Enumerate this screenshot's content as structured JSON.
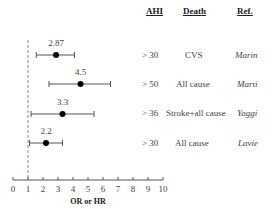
{
  "chart_data": {
    "type": "forest",
    "title": "",
    "xlabel": "OR or HR",
    "ylabel": "",
    "xlim": [
      0,
      10
    ],
    "x_ticks": [
      "0",
      "1",
      "2",
      "3",
      "4",
      "5",
      "6",
      "7",
      "8",
      "9",
      "10"
    ],
    "reference_line": 1,
    "grid": false,
    "columns": [
      "AHI",
      "Death",
      "Ref."
    ],
    "rows": [
      {
        "estimate": 2.87,
        "label": "2.87",
        "ci_low": 1.55,
        "ci_high": 4.1,
        "ahi": "> 30",
        "death": "CVS",
        "ref": "Marin"
      },
      {
        "estimate": 4.5,
        "label": "4.5",
        "ci_low": 2.4,
        "ci_high": 6.5,
        "ahi": "> 50",
        "death": "All cause",
        "ref": "Marti"
      },
      {
        "estimate": 3.3,
        "label": "3.3",
        "ci_low": 1.2,
        "ci_high": 5.4,
        "ahi": "> 36",
        "death": "Stroke+all cause",
        "ref": "Yaggi"
      },
      {
        "estimate": 2.2,
        "label": "2.2",
        "ci_low": 1.1,
        "ci_high": 3.3,
        "ahi": "> 30",
        "death": "All cause",
        "ref": "Lavie"
      }
    ]
  },
  "headers": {
    "ahi": "AHI",
    "death": "Death",
    "ref": "Ref."
  }
}
